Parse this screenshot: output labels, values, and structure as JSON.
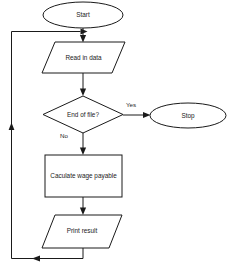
{
  "diagram": {
    "type": "flowchart",
    "orientation": "top-to-bottom",
    "background_color": "#ffffff",
    "line_color": "#1a1a1a",
    "nodes": [
      {
        "id": "start",
        "label": "Start",
        "shape": "terminator-ellipse"
      },
      {
        "id": "read",
        "label": "Read in data",
        "shape": "parallelogram-io"
      },
      {
        "id": "decision",
        "label": "End of file?",
        "shape": "diamond-decision"
      },
      {
        "id": "stop",
        "label": "Stop",
        "shape": "terminator-ellipse"
      },
      {
        "id": "calculate",
        "label": "Caculate wage payable",
        "shape": "rectangle-process"
      },
      {
        "id": "print",
        "label": "Print result",
        "shape": "parallelogram-io"
      }
    ],
    "edges": [
      {
        "id": "e-start-read",
        "from": "start",
        "to": "read",
        "label": ""
      },
      {
        "id": "e-read-decision",
        "from": "read",
        "to": "decision",
        "label": ""
      },
      {
        "id": "e-decision-stop",
        "from": "decision",
        "to": "stop",
        "label": "Yes"
      },
      {
        "id": "e-decision-calculate",
        "from": "decision",
        "to": "calculate",
        "label": "No"
      },
      {
        "id": "e-calculate-print",
        "from": "calculate",
        "to": "print",
        "label": ""
      },
      {
        "id": "e-print-loop",
        "from": "print",
        "to": "read",
        "label": ""
      }
    ]
  }
}
